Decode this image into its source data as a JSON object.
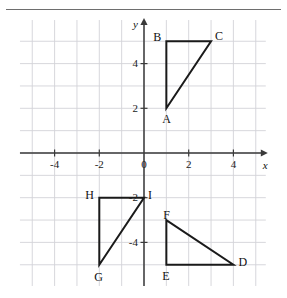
{
  "figure": {
    "title": "",
    "separator_rule": true
  },
  "chart_data": {
    "type": "scatter",
    "title": "",
    "subtitle": "",
    "xlabel": "x",
    "ylabel": "y",
    "xlim": [
      -5.55,
      5.45
    ],
    "ylim": [
      -5.95,
      5.95
    ],
    "grid": true,
    "grid_step": 1,
    "legend": "none",
    "x_tick_labels": [
      "-4",
      "-2",
      "0",
      "2",
      "4"
    ],
    "x_tick_values": [
      -4,
      -2,
      0,
      2,
      4
    ],
    "y_tick_labels": [
      "4",
      "2",
      "-2",
      "-4"
    ],
    "y_tick_values": [
      4,
      2,
      -2,
      -4
    ],
    "axis_arrows": [
      "x-positive",
      "y-positive"
    ],
    "shapes": [
      {
        "name": "triangle-abc",
        "closed": true,
        "vertices": [
          {
            "label": "A",
            "x": 1,
            "y": 2,
            "label_dx": -4,
            "label_dy": 11
          },
          {
            "label": "B",
            "x": 1,
            "y": 5,
            "label_dx": -13,
            "label_dy": -4
          },
          {
            "label": "C",
            "x": 3,
            "y": 5,
            "label_dx": 4,
            "label_dy": -5
          }
        ]
      },
      {
        "name": "triangle-def",
        "closed": true,
        "vertices": [
          {
            "label": "D",
            "x": 4,
            "y": -5,
            "label_dx": 5,
            "label_dy": -3
          },
          {
            "label": "E",
            "x": 1,
            "y": -5,
            "label_dx": -4,
            "label_dy": 11
          },
          {
            "label": "F",
            "x": 1,
            "y": -3,
            "label_dx": -3,
            "label_dy": -5
          }
        ]
      },
      {
        "name": "triangle-ghi",
        "closed": true,
        "vertices": [
          {
            "label": "G",
            "x": -2,
            "y": -5,
            "label_dx": -5,
            "label_dy": 12
          },
          {
            "label": "H",
            "x": -2,
            "y": -2,
            "label_dx": -14,
            "label_dy": -3
          },
          {
            "label": "I",
            "x": 0,
            "y": -2,
            "label_dx": 4,
            "label_dy": -3
          }
        ]
      }
    ]
  },
  "axis_labels": {
    "x_axis_name": "x",
    "y_axis_name": "y"
  }
}
